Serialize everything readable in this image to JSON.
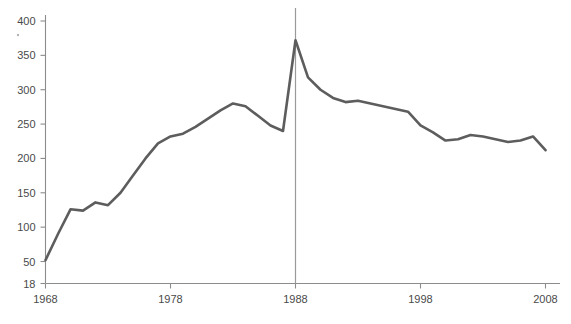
{
  "chart_data": {
    "type": "line",
    "title": "",
    "subtitle": "",
    "xlabel": "",
    "ylabel": "",
    "xlim": [
      1968,
      2008
    ],
    "ylim": [
      18,
      400
    ],
    "grid": false,
    "legend": "none",
    "line_color": "#5d5d5d",
    "axis_color": "#8c8c8c",
    "marker_line_color": "#9a9a9a",
    "y_ticks": [
      18,
      50,
      100,
      150,
      200,
      250,
      300,
      350,
      400
    ],
    "y_tick_labels": [
      "18",
      "50",
      "100",
      "150",
      "200",
      "250",
      "300",
      "350",
      "400"
    ],
    "x_ticks": [
      1968,
      1978,
      1988,
      1998,
      2008
    ],
    "x_tick_labels": [
      "1968",
      "1978",
      "1988",
      "1998",
      "2008"
    ],
    "annotations": [
      {
        "name": "vertical-marker-1988",
        "x": 1988,
        "label": "1988"
      }
    ],
    "series": [
      {
        "name": "value",
        "x": [
          1968,
          1969,
          1970,
          1971,
          1972,
          1973,
          1974,
          1975,
          1976,
          1977,
          1978,
          1979,
          1980,
          1981,
          1982,
          1983,
          1984,
          1985,
          1986,
          1987,
          1988,
          1989,
          1990,
          1991,
          1992,
          1993,
          1994,
          1995,
          1996,
          1997,
          1998,
          1999,
          2000,
          2001,
          2002,
          2003,
          2004,
          2005,
          2006,
          2007,
          2008
        ],
        "values": [
          52,
          90,
          126,
          124,
          136,
          132,
          150,
          175,
          200,
          222,
          232,
          236,
          246,
          258,
          270,
          280,
          276,
          262,
          248,
          240,
          372,
          318,
          300,
          288,
          282,
          284,
          280,
          276,
          272,
          268,
          248,
          238,
          226,
          228,
          234,
          232,
          228,
          224,
          226,
          232,
          212
        ]
      }
    ]
  }
}
